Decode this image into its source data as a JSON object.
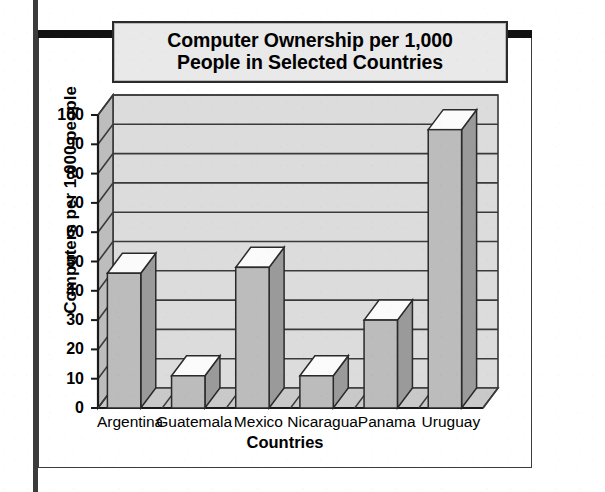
{
  "figure": {
    "title": "Computer Ownership per 1,000 People in Selected Countries",
    "title_line1": "Computer Ownership per 1,000",
    "title_line2": "People in Selected Countries"
  },
  "colors": {
    "frame_border": "#3b3b3b",
    "frame_top_bar": "#111111",
    "title_plate_fill": "#e9e9e9",
    "plot_floor": "#c9c9c9",
    "plot_back_wall": "#dcdcdc",
    "plot_side_wall": "#bdbdbd",
    "bar_front": "#bcbcbc",
    "bar_top": "#fbfbfb",
    "bar_side": "#9a9a9a",
    "gridline": "#3a3a3a",
    "text": "#000000"
  },
  "chart_data": {
    "type": "bar",
    "title": "Computer Ownership per 1,000 People in Selected Countries",
    "xlabel": "Countries",
    "ylabel": "Computers per 1,000 people",
    "categories": [
      "Argentina",
      "Guatemala",
      "Mexico",
      "Nicaragua",
      "Panama",
      "Uruguay"
    ],
    "values": [
      46,
      11,
      48,
      11,
      30,
      95
    ],
    "ylim": [
      0,
      100
    ],
    "yticks": [
      0,
      10,
      20,
      30,
      40,
      50,
      60,
      70,
      80,
      90,
      100
    ],
    "ytick_labels": [
      "0",
      "10",
      "20",
      "30",
      "40",
      "50",
      "60",
      "70",
      "80",
      "90",
      "100"
    ],
    "grid": true,
    "legend": null,
    "style": "3d-column"
  }
}
